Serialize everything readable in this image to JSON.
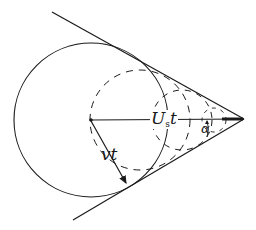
{
  "diagram": {
    "type": "geometry-figure",
    "labels": {
      "source_distance_main": "U",
      "source_distance_sub": "s",
      "source_distance_tail": "t",
      "wave_radius": "vt",
      "cone_angle": "α"
    },
    "colors": {
      "ink": "#1a1a1a",
      "background": "#ffffff"
    },
    "geometry": {
      "solid_circle": {
        "cx": 91,
        "cy": 120,
        "r": 77
      },
      "dashed_circles": [
        {
          "cx": 140,
          "cy": 120,
          "r": 50
        },
        {
          "cx": 182,
          "cy": 120,
          "r": 30
        },
        {
          "cx": 214,
          "cy": 120,
          "r": 12
        }
      ],
      "apex": {
        "x": 244,
        "y": 119
      },
      "upper_tangent_start": {
        "x": 52,
        "y": 12
      },
      "lower_tangent_start": {
        "x": 73,
        "y": 220
      },
      "radius_arrow_end": {
        "x": 128,
        "y": 187
      }
    }
  }
}
